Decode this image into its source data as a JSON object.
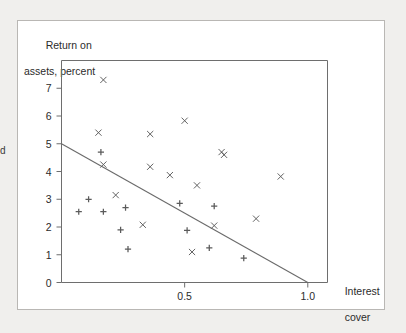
{
  "figure": {
    "background_color": "#f0efed",
    "card_color": "#ffffff",
    "border_color": "#b9b7b4",
    "left_margin_text": "d"
  },
  "chart_data": {
    "type": "scatter",
    "title": "",
    "subtitle": "",
    "xlabel": "Interest cover",
    "xlabel_lines": [
      "Interest",
      "cover"
    ],
    "ylabel": "Return on assets, percent",
    "ylabel_lines": [
      "Return on",
      "assets, percent"
    ],
    "xlim": [
      0,
      1.08
    ],
    "ylim": [
      0,
      8.0
    ],
    "xticks": [
      0.5,
      1.0
    ],
    "xtick_labels": [
      "0.5",
      "1.0"
    ],
    "yticks": [
      0,
      1,
      2,
      3,
      4,
      5,
      6,
      7
    ],
    "ytick_labels": [
      "0",
      "1",
      "2",
      "3",
      "4",
      "5",
      "6",
      "7"
    ],
    "grid": false,
    "legend": "none",
    "marker_color": "#5b5b5b",
    "line_color": "#6a6a6a",
    "series": [
      {
        "name": "cross-markers",
        "marker": "x",
        "points": [
          [
            0.17,
            7.3
          ],
          [
            0.15,
            5.4
          ],
          [
            0.5,
            5.83
          ],
          [
            0.36,
            5.35
          ],
          [
            0.17,
            4.25
          ],
          [
            0.66,
            4.6
          ],
          [
            0.36,
            4.17
          ],
          [
            0.44,
            3.87
          ],
          [
            0.89,
            3.82
          ],
          [
            0.55,
            3.5
          ],
          [
            0.22,
            3.15
          ],
          [
            0.65,
            4.7
          ],
          [
            0.33,
            2.08
          ],
          [
            0.79,
            2.3
          ],
          [
            0.62,
            2.05
          ],
          [
            0.53,
            1.1
          ]
        ]
      },
      {
        "name": "plus-markers",
        "marker": "+",
        "points": [
          [
            0.16,
            4.7
          ],
          [
            0.11,
            3.0
          ],
          [
            0.07,
            2.55
          ],
          [
            0.17,
            2.55
          ],
          [
            0.26,
            2.7
          ],
          [
            0.48,
            2.85
          ],
          [
            0.62,
            2.75
          ],
          [
            0.24,
            1.9
          ],
          [
            0.51,
            1.88
          ],
          [
            0.27,
            1.2
          ],
          [
            0.6,
            1.25
          ],
          [
            0.74,
            0.88
          ]
        ]
      }
    ],
    "trend_line": {
      "name": "fitted-regression-line",
      "x_start": 0.0,
      "y_start": 5.0,
      "x_end": 1.0,
      "y_end": 0.0
    }
  }
}
